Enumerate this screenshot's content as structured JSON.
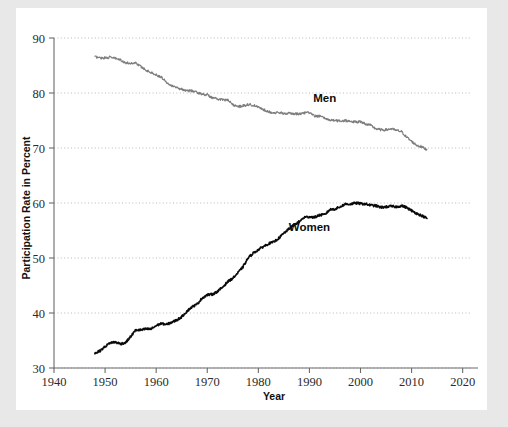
{
  "chart_data": {
    "type": "line",
    "title": "",
    "xlabel": "Year",
    "ylabel": "Participation Rate in Percent",
    "xlim": [
      1940,
      2023
    ],
    "ylim": [
      30,
      90
    ],
    "xticks": [
      1940,
      1950,
      1960,
      1970,
      1980,
      1990,
      2000,
      2010,
      2020
    ],
    "yticks": [
      30,
      40,
      50,
      60,
      70,
      80,
      90
    ],
    "grid": "horizontal-dotted",
    "legend_position": "inline-annotations",
    "annotations": [
      {
        "text": "Men",
        "x": 1993,
        "y": 78.4
      },
      {
        "text": "Women",
        "x": 1990,
        "y": 55.0
      }
    ],
    "series": [
      {
        "name": "Men",
        "color": "#7d7d7d",
        "x": [
          1948,
          1949,
          1950,
          1951,
          1952,
          1953,
          1954,
          1955,
          1956,
          1957,
          1958,
          1959,
          1960,
          1961,
          1962,
          1963,
          1964,
          1965,
          1966,
          1967,
          1968,
          1969,
          1970,
          1971,
          1972,
          1973,
          1974,
          1975,
          1976,
          1977,
          1978,
          1979,
          1980,
          1981,
          1982,
          1983,
          1984,
          1985,
          1986,
          1987,
          1988,
          1989,
          1990,
          1991,
          1992,
          1993,
          1994,
          1995,
          1996,
          1997,
          1998,
          1999,
          2000,
          2001,
          2002,
          2003,
          2004,
          2005,
          2006,
          2007,
          2008,
          2009,
          2010,
          2011,
          2012,
          2013
        ],
        "values": [
          86.6,
          86.4,
          86.4,
          86.5,
          86.3,
          86.0,
          85.5,
          85.4,
          85.5,
          84.8,
          84.2,
          83.7,
          83.3,
          82.9,
          82.0,
          81.4,
          81.0,
          80.7,
          80.4,
          80.4,
          80.1,
          79.8,
          79.7,
          79.1,
          78.9,
          78.8,
          78.7,
          77.9,
          77.5,
          77.7,
          77.9,
          77.8,
          77.4,
          77.0,
          76.6,
          76.4,
          76.4,
          76.3,
          76.3,
          76.2,
          76.2,
          76.4,
          76.4,
          75.8,
          75.8,
          75.4,
          75.1,
          75.0,
          74.9,
          75.0,
          74.9,
          74.7,
          74.8,
          74.4,
          74.1,
          73.5,
          73.3,
          73.3,
          73.5,
          73.2,
          73.0,
          72.0,
          71.2,
          70.5,
          70.2,
          69.7
        ]
      },
      {
        "name": "Women",
        "color": "#0a0a0a",
        "x": [
          1948,
          1949,
          1950,
          1951,
          1952,
          1953,
          1954,
          1955,
          1956,
          1957,
          1958,
          1959,
          1960,
          1961,
          1962,
          1963,
          1964,
          1965,
          1966,
          1967,
          1968,
          1969,
          1970,
          1971,
          1972,
          1973,
          1974,
          1975,
          1976,
          1977,
          1978,
          1979,
          1980,
          1981,
          1982,
          1983,
          1984,
          1985,
          1986,
          1987,
          1988,
          1989,
          1990,
          1991,
          1992,
          1993,
          1994,
          1995,
          1996,
          1997,
          1998,
          1999,
          2000,
          2001,
          2002,
          2003,
          2004,
          2005,
          2006,
          2007,
          2008,
          2009,
          2010,
          2011,
          2012,
          2013
        ],
        "values": [
          32.7,
          33.1,
          33.9,
          34.6,
          34.7,
          34.4,
          34.6,
          35.7,
          36.9,
          36.9,
          37.1,
          37.1,
          37.7,
          38.1,
          37.9,
          38.3,
          38.7,
          39.3,
          40.3,
          41.1,
          41.6,
          42.7,
          43.3,
          43.4,
          43.9,
          44.7,
          45.7,
          46.3,
          47.3,
          48.4,
          50.0,
          50.9,
          51.5,
          52.1,
          52.6,
          52.9,
          53.6,
          54.5,
          55.3,
          56.0,
          56.6,
          57.4,
          57.5,
          57.4,
          57.8,
          57.9,
          58.8,
          58.9,
          59.3,
          59.8,
          59.8,
          60.0,
          59.9,
          59.8,
          59.6,
          59.5,
          59.2,
          59.3,
          59.4,
          59.3,
          59.5,
          59.2,
          58.6,
          58.1,
          57.7,
          57.2
        ]
      }
    ]
  },
  "axes": {
    "y_title": "Participation Rate in Percent",
    "x_title": "Year",
    "y_tick_labels": [
      "30",
      "40",
      "50",
      "60",
      "70",
      "80",
      "90"
    ],
    "x_tick_labels": [
      "1940",
      "1950",
      "1960",
      "1970",
      "1980",
      "1990",
      "2000",
      "2010",
      "2020"
    ]
  },
  "labels": {
    "men": "Men",
    "women": "Women"
  },
  "colors": {
    "background": "#e8e8e8",
    "panel": "#ffffff",
    "men_line": "#7d7d7d",
    "women_line": "#0a0a0a",
    "gridline": "#b9b9b9",
    "axis": "#6b6b6b"
  }
}
